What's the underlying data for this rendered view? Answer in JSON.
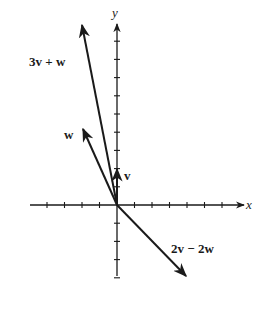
{
  "figure": {
    "type": "vector-diagram",
    "axes": {
      "x_label": "x",
      "y_label": "y",
      "x_ticks": [
        -4,
        -3,
        -2,
        -1,
        1,
        2,
        3,
        4,
        5,
        6
      ],
      "y_ticks": [
        -4,
        -3,
        -2,
        -1,
        1,
        2,
        3,
        4,
        5,
        6,
        7,
        8,
        9
      ],
      "xlim": [
        -5,
        7
      ],
      "ylim": [
        -4,
        10
      ]
    },
    "vectors": [
      {
        "name": "v",
        "label": "v",
        "components": [
          0,
          2
        ]
      },
      {
        "name": "w",
        "label": "w",
        "components": [
          -2,
          4
        ]
      },
      {
        "name": "3v+w",
        "label": "3v + w",
        "components": [
          -2,
          10
        ]
      },
      {
        "name": "2v-2w",
        "label": "2v − 2w",
        "components": [
          4,
          -4
        ]
      }
    ],
    "colors": {
      "ink": "#1a1a1a",
      "background": "#ffffff"
    }
  }
}
